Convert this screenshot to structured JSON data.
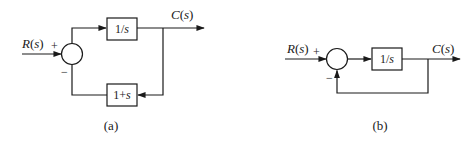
{
  "diagrams": [
    {
      "id": "a",
      "caption": "(a)",
      "input_label": "R(s)",
      "output_label": "C(s)",
      "sum_signs": {
        "input": "+",
        "feedback": "−"
      },
      "forward_block": "1/s",
      "feedback_block": "1+s"
    },
    {
      "id": "b",
      "caption": "(b)",
      "input_label": "R(s)",
      "output_label": "C(s)",
      "sum_signs": {
        "input": "+",
        "feedback": "−"
      },
      "forward_block": "1/s",
      "feedback_block": null
    }
  ],
  "colors": {
    "line": "#1a1a1a",
    "background": "#ffffff"
  }
}
